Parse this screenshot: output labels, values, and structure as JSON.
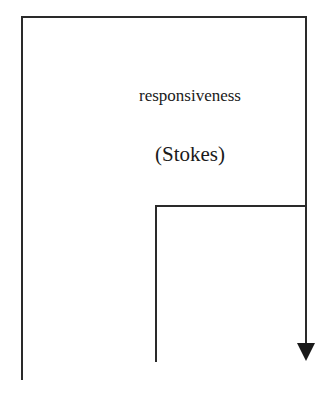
{
  "diagram": {
    "type": "flow-path",
    "labels": {
      "main": "responsiveness",
      "sub": "(Stokes)"
    },
    "stroke_color": "#2a2a2a",
    "background_color": "#ffffff",
    "paths": {
      "outer": {
        "points": [
          [
            22,
            380
          ],
          [
            22,
            17
          ],
          [
            306,
            17
          ],
          [
            306,
            345
          ]
        ]
      },
      "inner": {
        "points": [
          [
            156,
            362
          ],
          [
            156,
            206
          ],
          [
            306,
            206
          ]
        ]
      }
    },
    "arrowhead": {
      "direction": "down",
      "tip": [
        306,
        361
      ]
    }
  }
}
